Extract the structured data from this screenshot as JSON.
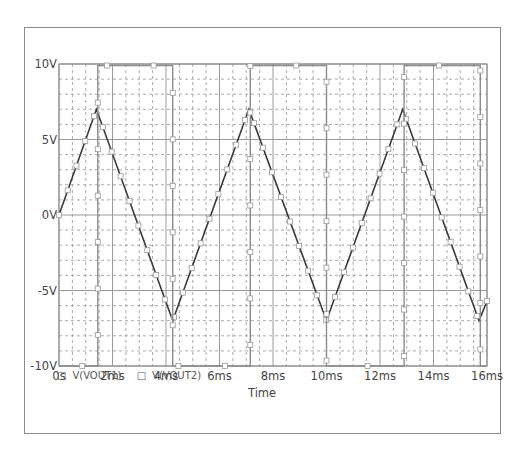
{
  "chart_data": {
    "type": "line",
    "title": "",
    "xlabel": "Time",
    "ylabel": "",
    "xlim_ms": [
      0,
      16
    ],
    "ylim": [
      -10,
      10
    ],
    "x_ticks": [
      "0s",
      "2ms",
      "4ms",
      "6ms",
      "8ms",
      "10ms",
      "12ms",
      "14ms",
      "16ms"
    ],
    "y_ticks": [
      "10V",
      "5V",
      "0V",
      "-5V",
      "-10V"
    ],
    "grid": true,
    "legend_position": "bottom-left",
    "series": [
      {
        "name": "V(VOUT1)",
        "shape": "triangle",
        "x_ms": [
          0,
          1.4,
          4.25,
          7.1,
          10.0,
          12.85,
          15.7,
          16.0
        ],
        "y_v": [
          0,
          7,
          -7,
          7,
          -7,
          7,
          -7,
          -5.7
        ]
      },
      {
        "name": "V(VOUT2)",
        "shape": "square",
        "x_ms": [
          0,
          1.45,
          1.45,
          4.25,
          4.25,
          7.15,
          7.15,
          10.0,
          10.0,
          12.9,
          12.9,
          15.75,
          15.75,
          16.0
        ],
        "y_v": [
          -10,
          -10,
          9.9,
          9.9,
          -10,
          -10,
          9.9,
          9.9,
          -10,
          -10,
          9.9,
          9.9,
          -10,
          -10
        ]
      }
    ]
  },
  "legend": {
    "items": [
      {
        "marker": "□",
        "label": "V(VOUT1)"
      },
      {
        "marker": "□",
        "label": "V(VOUT2)"
      }
    ]
  },
  "axis": {
    "xlabel": "Time"
  }
}
